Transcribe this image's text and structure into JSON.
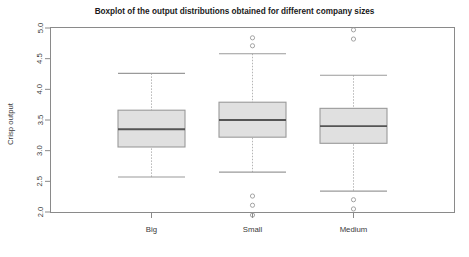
{
  "chart_data": {
    "type": "boxplot",
    "title": "Boxplot of the output distributions obtained for different company sizes",
    "xlabel": "",
    "ylabel": "Crisp output",
    "ylim": [
      2.0,
      5.0
    ],
    "ytick_labels": [
      "2.0",
      "2.5",
      "3.0",
      "3.5",
      "4.0",
      "4.5",
      "5.0"
    ],
    "ytick_values": [
      2.0,
      2.5,
      3.0,
      3.5,
      4.0,
      4.5,
      5.0
    ],
    "grid": false,
    "legend": null,
    "categories": [
      "Big",
      "Small",
      "Medium"
    ],
    "boxes": [
      {
        "name": "Big",
        "whisker_low": 2.57,
        "q1": 3.06,
        "median": 3.35,
        "q3": 3.66,
        "whisker_high": 4.26,
        "outliers": []
      },
      {
        "name": "Small",
        "whisker_low": 2.65,
        "q1": 3.22,
        "median": 3.5,
        "q3": 3.79,
        "whisker_high": 4.58,
        "outliers": [
          4.84,
          4.71,
          2.26,
          2.11,
          1.95
        ]
      },
      {
        "name": "Medium",
        "whisker_low": 2.34,
        "q1": 3.12,
        "median": 3.4,
        "q3": 3.69,
        "whisker_high": 4.23,
        "outliers": [
          4.97,
          4.82,
          2.2,
          2.05
        ]
      }
    ],
    "colors": {
      "box_fill": "#e0e0e0",
      "box_stroke": "#9a9a9a",
      "median": "#555555",
      "whisker": "#b5b5b5",
      "axis": "#8a8a8a",
      "text": "#3a3a3a",
      "title": "#1a1a1a",
      "background": "#ffffff"
    }
  }
}
